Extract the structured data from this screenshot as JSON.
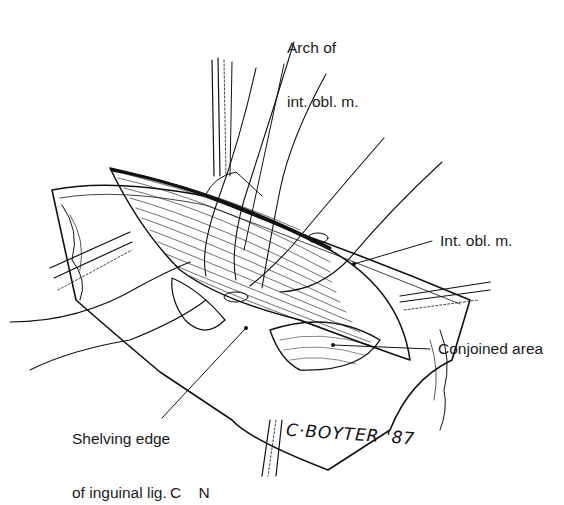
{
  "figure": {
    "labels": {
      "arch": {
        "line1": "Arch of",
        "line2": "int. obl. m."
      },
      "int_obl": "Int. obl. m.",
      "conjoined": "Conjoined area",
      "shelving": {
        "line1": "Shelving edge",
        "line2": "of inguinal lig."
      }
    },
    "signature": "C·BOYTER '87",
    "caption_partial": "C    N"
  },
  "colors": {
    "ink": "#111111",
    "background": "#ffffff"
  }
}
